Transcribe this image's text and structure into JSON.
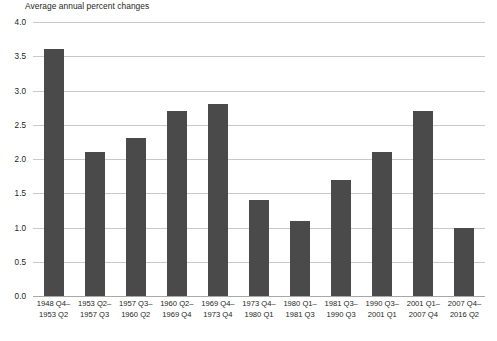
{
  "chart_data": {
    "type": "bar",
    "title": "Average annual percent changes",
    "xlabel": "",
    "ylabel": "",
    "ylim": [
      0.0,
      4.0
    ],
    "ytick_labels": [
      "4.0",
      "3.5",
      "3.0",
      "2.5",
      "2.0",
      "1.5",
      "1.0",
      "0.5",
      "0.0"
    ],
    "ytick_values": [
      4.0,
      3.5,
      3.0,
      2.5,
      2.0,
      1.5,
      1.0,
      0.5,
      0.0
    ],
    "grid": true,
    "legend": "none",
    "bar_color": "#4a4a4a",
    "gridline_color": "#c9c9c9",
    "categories": [
      "1948 Q4– 1953 Q2",
      "1953 Q2– 1957 Q3",
      "1957 Q3– 1960 Q2",
      "1960 Q2– 1969 Q4",
      "1969 Q4– 1973 Q4",
      "1973 Q4– 1980 Q1",
      "1980 Q1– 1981 Q3",
      "1981 Q3– 1990 Q3",
      "1990 Q3– 2001 Q1",
      "2001 Q1– 2007 Q4",
      "2007 Q4– 2016 Q2"
    ],
    "category_lines": [
      {
        "line1": "1948 Q4–",
        "line2": "1953 Q2"
      },
      {
        "line1": "1953 Q2–",
        "line2": "1957 Q3"
      },
      {
        "line1": "1957 Q3–",
        "line2": "1960 Q2"
      },
      {
        "line1": "1960 Q2–",
        "line2": "1969 Q4"
      },
      {
        "line1": "1969 Q4–",
        "line2": "1973 Q4"
      },
      {
        "line1": "1973 Q4–",
        "line2": "1980 Q1"
      },
      {
        "line1": "1980 Q1–",
        "line2": "1981 Q3"
      },
      {
        "line1": "1981 Q3–",
        "line2": "1990 Q3"
      },
      {
        "line1": "1990 Q3–",
        "line2": "2001 Q1"
      },
      {
        "line1": "2001 Q1–",
        "line2": "2007 Q4"
      },
      {
        "line1": "2007 Q4–",
        "line2": "2016 Q2"
      }
    ],
    "values": [
      3.6,
      2.1,
      2.3,
      2.7,
      2.8,
      1.4,
      1.1,
      1.7,
      2.1,
      2.7,
      1.0
    ]
  }
}
